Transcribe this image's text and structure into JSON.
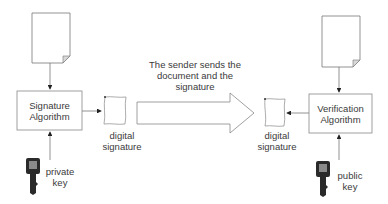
{
  "diagram": {
    "signer": {
      "algorithm_box": {
        "line1": "Signature",
        "line2": "Algorithm"
      },
      "signature_label": {
        "line1": "digital",
        "line2": "signature"
      },
      "key_label": {
        "line1": "private",
        "line2": "key"
      },
      "document_icon": "document-icon",
      "key_icon": "key-icon",
      "signature_icon": "scroll-icon"
    },
    "transfer": {
      "label": {
        "line1": "The sender sends the",
        "line2": "document and the",
        "line3": "signature"
      },
      "arrow_icon": "block-arrow-right"
    },
    "verifier": {
      "algorithm_box": {
        "line1": "Verification",
        "line2": "Algorithm"
      },
      "signature_label": {
        "line1": "digital",
        "line2": "signature"
      },
      "key_label": {
        "line1": "public",
        "line2": "key"
      },
      "document_icon": "document-icon",
      "key_icon": "key-icon",
      "signature_icon": "scroll-icon"
    },
    "colors": {
      "line": "#777777",
      "arrow_head": "#222222",
      "key_dark": "#2a2a2a",
      "key_screen": "#8a8a8a",
      "fold": "#d8d8d8"
    }
  }
}
